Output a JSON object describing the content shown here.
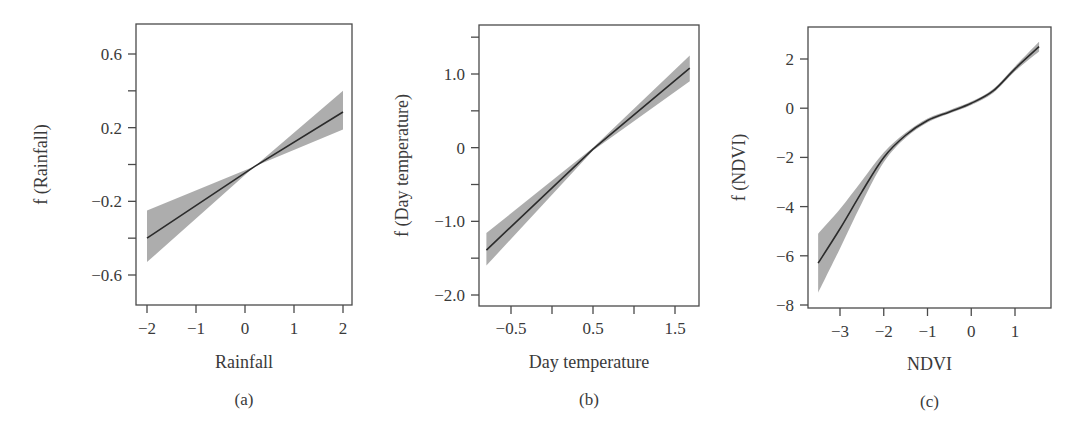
{
  "chart_data": [
    {
      "id": "a",
      "type": "line",
      "caption": "(a)",
      "title": "",
      "xlabel": "Rainfall",
      "ylabel": "f (Rainfall)",
      "xlim": [
        -2.2,
        2.2
      ],
      "ylim": [
        -0.78,
        0.76
      ],
      "xticks": [
        -2,
        -1,
        0,
        1,
        2
      ],
      "xtick_labels": [
        "−2",
        "−1",
        "0",
        "1",
        "2"
      ],
      "yticks": [
        -0.6,
        -0.4,
        -0.2,
        0,
        0.2,
        0.4,
        0.6
      ],
      "ytick_labels": [
        "−0.6",
        "",
        "−0.2",
        "",
        "0.2",
        "",
        "0.6"
      ],
      "grid": false,
      "legend": null,
      "series": [
        {
          "name": "fit",
          "x": [
            -2,
            0.2,
            2
          ],
          "y": [
            -0.4,
            -0.01,
            0.285
          ]
        },
        {
          "name": "ci_upper",
          "x": [
            -2,
            0.2,
            2
          ],
          "y": [
            -0.25,
            -0.01,
            0.4
          ]
        },
        {
          "name": "ci_lower",
          "x": [
            -2,
            0.2,
            2
          ],
          "y": [
            -0.53,
            -0.01,
            0.19
          ]
        }
      ]
    },
    {
      "id": "b",
      "type": "line",
      "caption": "(b)",
      "title": "",
      "xlabel": "Day temperature",
      "ylabel": "f (Day temperature)",
      "xlim": [
        -0.89,
        1.79
      ],
      "ylim": [
        -2.15,
        1.65
      ],
      "xticks": [
        -0.5,
        0,
        0.5,
        1.0,
        1.5
      ],
      "xtick_labels": [
        "−0.5",
        "",
        "0.5",
        "",
        "1.5"
      ],
      "yticks": [
        -2.0,
        -1.5,
        -1.0,
        -0.5,
        0,
        0.5,
        1.0,
        1.5
      ],
      "ytick_labels": [
        "−2.0",
        "",
        "−1.0",
        "",
        "0",
        "",
        "1.0",
        ""
      ],
      "grid": false,
      "legend": null,
      "series": [
        {
          "name": "fit",
          "x": [
            -0.8,
            0.5,
            1.68
          ],
          "y": [
            -1.39,
            -0.02,
            1.08
          ]
        },
        {
          "name": "ci_upper",
          "x": [
            -0.8,
            0.5,
            1.68
          ],
          "y": [
            -1.16,
            0.0,
            1.25
          ]
        },
        {
          "name": "ci_lower",
          "x": [
            -0.8,
            0.5,
            1.68
          ],
          "y": [
            -1.6,
            -0.04,
            0.9
          ]
        }
      ]
    },
    {
      "id": "c",
      "type": "line",
      "caption": "(c)",
      "title": "",
      "xlabel": "NDVI",
      "ylabel": "f (NDVI)",
      "xlim": [
        -3.73,
        1.83
      ],
      "ylim": [
        -8.1,
        3.3
      ],
      "xticks": [
        -3,
        -2,
        -1,
        0,
        1
      ],
      "xtick_labels": [
        "−3",
        "−2",
        "−1",
        "0",
        "1"
      ],
      "yticks": [
        -8,
        -6,
        -4,
        -2,
        0,
        2
      ],
      "ytick_labels": [
        "−8",
        "−6",
        "−4",
        "−2",
        "0",
        "2"
      ],
      "grid": false,
      "legend": null,
      "series": [
        {
          "name": "fit",
          "x": [
            -3.5,
            -3.0,
            -2.5,
            -2.0,
            -1.5,
            -1.0,
            -0.5,
            0.0,
            0.5,
            1.0,
            1.55
          ],
          "y": [
            -6.3,
            -4.9,
            -3.4,
            -2.0,
            -1.1,
            -0.5,
            -0.15,
            0.2,
            0.7,
            1.6,
            2.5
          ]
        },
        {
          "name": "ci_upper",
          "x": [
            -3.5,
            -3.0,
            -2.5,
            -2.0,
            -1.5,
            -1.0,
            -0.5,
            0.0,
            0.5,
            1.0,
            1.55
          ],
          "y": [
            -5.1,
            -4.1,
            -2.95,
            -1.8,
            -1.0,
            -0.42,
            -0.08,
            0.27,
            0.78,
            1.7,
            2.7
          ]
        },
        {
          "name": "ci_lower",
          "x": [
            -3.5,
            -3.0,
            -2.5,
            -2.0,
            -1.5,
            -1.0,
            -0.5,
            0.0,
            0.5,
            1.0,
            1.55
          ],
          "y": [
            -7.5,
            -5.7,
            -3.85,
            -2.2,
            -1.2,
            -0.58,
            -0.22,
            0.13,
            0.62,
            1.5,
            2.3
          ]
        }
      ]
    }
  ],
  "layout": {
    "panels": [
      {
        "frame": [
          136,
          24,
          352,
          305
        ],
        "xpx": [
          147,
          343
        ],
        "ypx": [
          54,
          275
        ],
        "yval": [
          0.6,
          -0.6
        ],
        "xval": [
          -2,
          2
        ],
        "ylabel_x": 47,
        "xlabel_y": 368,
        "caption_y": 405,
        "tick_label_y": 334
      },
      {
        "frame": [
          479,
          25,
          699,
          306
        ],
        "xpx": [
          511,
          675
        ],
        "ypx": [
          74,
          295
        ],
        "yval": [
          1.0,
          -2.0
        ],
        "xval": [
          -0.5,
          1.5
        ],
        "ylabel_x": 408,
        "xlabel_y": 368,
        "caption_y": 405,
        "tick_label_y": 334
      },
      {
        "frame": [
          808,
          27,
          1051,
          308
        ],
        "xpx": [
          840,
          1015
        ],
        "ypx": [
          59,
          305
        ],
        "yval": [
          2,
          -8
        ],
        "xval": [
          -3,
          1
        ],
        "ylabel_x": 745,
        "xlabel_y": 370,
        "caption_y": 407,
        "tick_label_y": 337
      }
    ]
  }
}
